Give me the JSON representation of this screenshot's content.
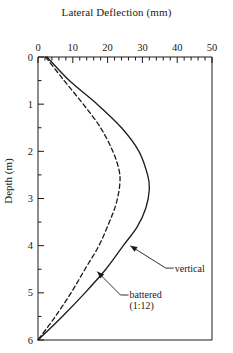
{
  "chart_data": {
    "type": "line",
    "title": "Lateral Deflection (mm)",
    "xlabel": "Lateral Deflection (mm)",
    "ylabel": "Depth (m)",
    "xlim": [
      0,
      50
    ],
    "ylim": [
      0,
      6
    ],
    "y_axis_inverted": true,
    "x_axis_position": "top",
    "grid": false,
    "legend": "none (inline annotations with leader lines)",
    "xticks": [
      0,
      10,
      20,
      30,
      40,
      50
    ],
    "xtick_labels": [
      "0",
      "10",
      "20",
      "30",
      "40",
      "50"
    ],
    "x_minor_tick_step": 2,
    "yticks": [
      0,
      1,
      2,
      3,
      4,
      5,
      6
    ],
    "ytick_labels": [
      "0",
      "1",
      "2",
      "3",
      "4",
      "5",
      "6"
    ],
    "y_minor_tick_step": 0.5,
    "series": [
      {
        "name": "vertical",
        "style": "solid",
        "color": "#1a1a1a",
        "x": [
          2.6,
          9.0,
          17.0,
          24.0,
          29.0,
          31.5,
          32.0,
          31.0,
          28.5,
          24.5,
          19.5,
          13.5,
          7.0,
          0.0
        ],
        "y": [
          0.0,
          0.5,
          1.0,
          1.5,
          2.0,
          2.5,
          2.8,
          3.2,
          3.6,
          4.0,
          4.5,
          5.0,
          5.5,
          6.0
        ]
      },
      {
        "name": "battered (1:12)",
        "style": "dashed",
        "color": "#1a1a1a",
        "x": [
          2.2,
          7.5,
          13.0,
          18.0,
          21.5,
          23.3,
          23.5,
          22.5,
          20.5,
          17.5,
          13.5,
          9.5,
          5.0,
          0.0
        ],
        "y": [
          0.0,
          0.5,
          1.0,
          1.5,
          2.0,
          2.4,
          2.7,
          3.1,
          3.5,
          4.0,
          4.5,
          5.0,
          5.5,
          6.0
        ]
      }
    ],
    "annotations": [
      {
        "text": "vertical",
        "target_x": 26.5,
        "target_y": 4.0,
        "label_x": 39.0,
        "label_y": 4.55
      },
      {
        "text_line1": "battered",
        "text_line2": "(1:12)",
        "target_x": 17.0,
        "target_y": 4.55,
        "label_x": 26.0,
        "label_y": 5.12
      }
    ]
  }
}
